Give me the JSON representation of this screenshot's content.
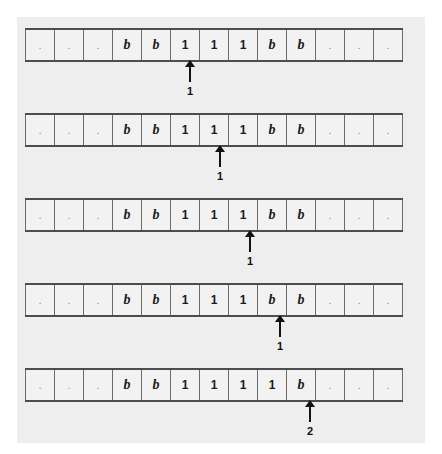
{
  "figure": {
    "type": "turing-machine-tape-trace",
    "tape_cell_count": 13,
    "symbols": {
      "blank": "b",
      "one": "1",
      "ellipsis": "."
    },
    "rows": [
      {
        "step": 1,
        "cells": [
          ".",
          ".",
          ".",
          "b",
          "b",
          "1",
          "1",
          "1",
          "b",
          "b",
          ".",
          ".",
          "."
        ],
        "head_index": 5,
        "state": "1"
      },
      {
        "step": 2,
        "cells": [
          ".",
          ".",
          ".",
          "b",
          "b",
          "1",
          "1",
          "1",
          "b",
          "b",
          ".",
          ".",
          "."
        ],
        "head_index": 6,
        "state": "1"
      },
      {
        "step": 3,
        "cells": [
          ".",
          ".",
          ".",
          "b",
          "b",
          "1",
          "1",
          "1",
          "b",
          "b",
          ".",
          ".",
          "."
        ],
        "head_index": 7,
        "state": "1"
      },
      {
        "step": 4,
        "cells": [
          ".",
          ".",
          ".",
          "b",
          "b",
          "1",
          "1",
          "1",
          "b",
          "b",
          ".",
          ".",
          "."
        ],
        "head_index": 8,
        "state": "1"
      },
      {
        "step": 5,
        "cells": [
          ".",
          ".",
          ".",
          "b",
          "b",
          "1",
          "1",
          "1",
          "1",
          "b",
          ".",
          ".",
          "."
        ],
        "head_index": 9,
        "state": "2"
      }
    ]
  },
  "colors": {
    "panel_background": "#eeeeee",
    "tape_background": "#f2f2f2",
    "tape_rule": "#4d4d4d",
    "cell_divider": "#6b6b6b",
    "text": "#1a1a1a",
    "head_marker": "#111111"
  }
}
